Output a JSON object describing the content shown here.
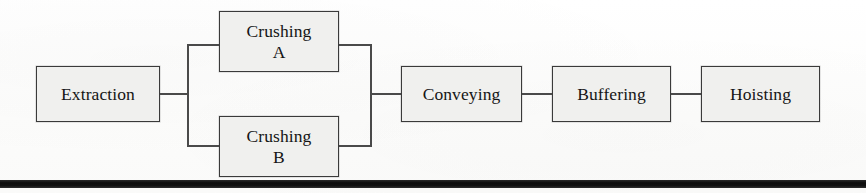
{
  "diagram": {
    "colors": {
      "node_fill": "#f0f0ee",
      "node_border": "#3a3a3a",
      "connector": "#4a4a4a",
      "rule": "#111111",
      "background": "#fdfdfc"
    },
    "nodes": [
      {
        "id": "extraction",
        "label": "Extraction",
        "x": 36,
        "y": 66,
        "w": 124,
        "h": 56
      },
      {
        "id": "crushing-a",
        "label": "Crushing\nA",
        "x": 219,
        "y": 11,
        "w": 120,
        "h": 61
      },
      {
        "id": "crushing-b",
        "label": "Crushing\nB",
        "x": 219,
        "y": 116,
        "w": 120,
        "h": 61
      },
      {
        "id": "conveying",
        "label": "Conveying",
        "x": 401,
        "y": 66,
        "w": 121,
        "h": 56
      },
      {
        "id": "buffering",
        "label": "Buffering",
        "x": 552,
        "y": 66,
        "w": 119,
        "h": 56
      },
      {
        "id": "hoisting",
        "label": "Hoisting",
        "x": 701,
        "y": 66,
        "w": 119,
        "h": 56
      }
    ],
    "edges": [
      {
        "id": "extraction-to-split",
        "from": "extraction",
        "to": "split-bus"
      },
      {
        "id": "split-to-crushing-a",
        "from": "split-bus",
        "to": "crushing-a"
      },
      {
        "id": "split-to-crushing-b",
        "from": "split-bus",
        "to": "crushing-b"
      },
      {
        "id": "crushing-a-to-merge",
        "from": "crushing-a",
        "to": "merge-bus"
      },
      {
        "id": "crushing-b-to-merge",
        "from": "crushing-b",
        "to": "merge-bus"
      },
      {
        "id": "merge-to-conveying",
        "from": "merge-bus",
        "to": "conveying"
      },
      {
        "id": "conveying-to-buffering",
        "from": "conveying",
        "to": "buffering"
      },
      {
        "id": "buffering-to-hoisting",
        "from": "buffering",
        "to": "hoisting"
      }
    ],
    "bottom_rule": {
      "x": 0,
      "y": 180,
      "w": 866,
      "h": 8
    }
  }
}
